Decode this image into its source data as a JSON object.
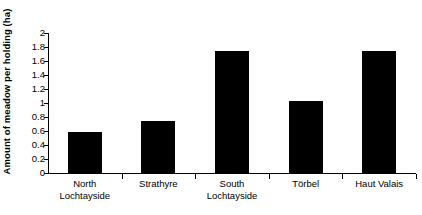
{
  "chart_data": {
    "type": "bar",
    "title": "",
    "subtitle": "",
    "xlabel": "",
    "ylabel": "Amount of meadow per holding (ha)",
    "categories": [
      "North Lochtayside",
      "Strathyre",
      "South Lochtayside",
      "Törbel",
      "Haut Valais"
    ],
    "category_lines": [
      [
        "North",
        "Lochtayside"
      ],
      [
        "Strathyre",
        ""
      ],
      [
        "South",
        "Lochtayside"
      ],
      [
        "Törbel",
        ""
      ],
      [
        "Haut Valais",
        ""
      ]
    ],
    "values": [
      0.58,
      0.74,
      1.74,
      1.03,
      1.75
    ],
    "ylim": [
      0,
      2
    ],
    "ytick_values": [
      0,
      0.2,
      0.4,
      0.6,
      0.8,
      1,
      1.2,
      1.4,
      1.6,
      1.8,
      2
    ],
    "ytick_labels": [
      "0",
      "0.2",
      "0.4",
      "0.6",
      "0.8",
      "1",
      "1.2",
      "1.4",
      "1.6",
      "1.8",
      "2"
    ],
    "grid": false,
    "legend": null,
    "legend_position": "none",
    "bar_color": "#000000",
    "axis_color": "#000000",
    "background_color": "#ffffff"
  }
}
